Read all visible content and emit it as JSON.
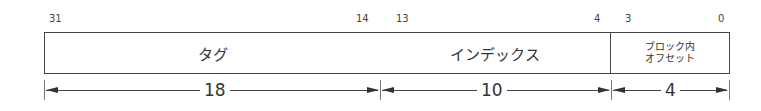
{
  "fields": [
    {
      "label": "タグ",
      "hi_bit": "31",
      "lo_bit": "14",
      "width": "18"
    },
    {
      "label": "インデックス",
      "hi_bit": "13",
      "lo_bit": "4",
      "width": "10"
    },
    {
      "label_line1": "ブロック内",
      "label_line2": "オフセット",
      "hi_bit": "3",
      "lo_bit": "0",
      "width": "4"
    }
  ]
}
